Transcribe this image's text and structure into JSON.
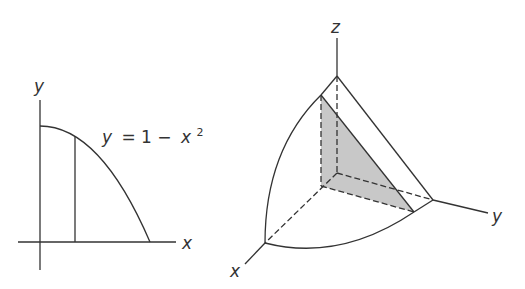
{
  "left_graph": {
    "y_axis_label": "y",
    "x_axis_label": "x",
    "curve_equation": {
      "lhs": "y",
      "eq": "= 1 −",
      "var": "x",
      "exp": "2"
    }
  },
  "right_graph": {
    "z_axis_label": "z",
    "y_axis_label": "y",
    "x_axis_label": "x",
    "cross_section_fill": "#c8c8c8"
  },
  "colors": {
    "stroke": "#333333",
    "background": "#ffffff"
  }
}
